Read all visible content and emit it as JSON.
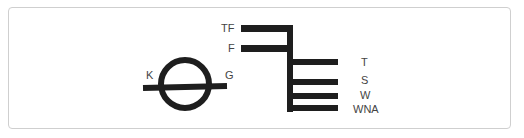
{
  "colors": {
    "stroke": "#1e1e1e",
    "label": "#444444",
    "frame": "#cfcfcf",
    "background": "#ffffff"
  },
  "symbols": {
    "left": {
      "name": "circle-with-bar",
      "labels": {
        "left": "K",
        "right": "G"
      }
    },
    "right": {
      "name": "branching-bar-symbol",
      "left_labels": [
        "TF",
        "F"
      ],
      "right_labels": [
        "T",
        "S",
        "W",
        "WNA"
      ]
    }
  }
}
